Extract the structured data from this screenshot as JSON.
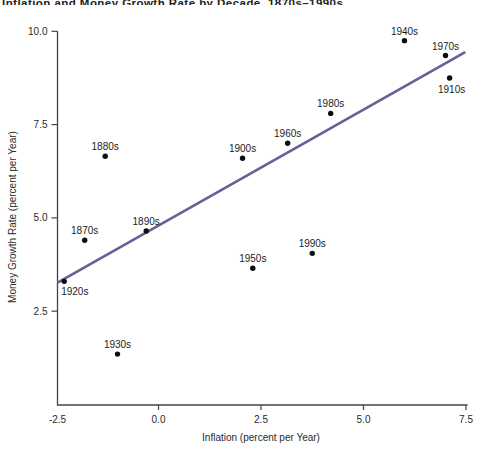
{
  "title_clipped": "Inflation and Money Growth Rate by Decade, 1870s–1990s",
  "colors": {
    "background": "#ffffff",
    "axis": "#454545",
    "tick_text": "#2a2a2a",
    "dot": "#0d0d0d",
    "label_text": "#1c1c1c",
    "trend_line": "#63639a"
  },
  "chart_data": {
    "type": "scatter",
    "xlabel": "Inflation (percent per Year)",
    "ylabel": "Money Growth Rate (percent per Year)",
    "xlim": [
      -2.5,
      7.5
    ],
    "ylim": [
      0,
      10
    ],
    "grid": false,
    "legend": "none",
    "x_ticks": {
      "values": [
        -2.5,
        0,
        2.5,
        5,
        7.5
      ],
      "labels": [
        "-2.5",
        "0.0",
        "2.5",
        "5.0",
        "7.5"
      ]
    },
    "y_ticks": {
      "values": [
        2.5,
        5,
        7.5,
        10
      ],
      "labels": [
        "2.5",
        "5.0",
        "7.5",
        "10.0"
      ]
    },
    "points": [
      {
        "label": "1870s",
        "x": -1.8,
        "y": 4.4,
        "label_pos": "above"
      },
      {
        "label": "1880s",
        "x": -1.3,
        "y": 6.65,
        "label_pos": "above"
      },
      {
        "label": "1890s",
        "x": -0.3,
        "y": 4.65,
        "label_pos": "above"
      },
      {
        "label": "1900s",
        "x": 2.05,
        "y": 6.6,
        "label_pos": "above"
      },
      {
        "label": "1910s",
        "x": 7.1,
        "y": 8.75,
        "label_pos": "below"
      },
      {
        "label": "1920s",
        "x": -2.3,
        "y": 3.3,
        "label_pos": "below-left"
      },
      {
        "label": "1930s",
        "x": -1.0,
        "y": 1.35,
        "label_pos": "above"
      },
      {
        "label": "1940s",
        "x": 6.0,
        "y": 9.75,
        "label_pos": "above"
      },
      {
        "label": "1950s",
        "x": 2.3,
        "y": 3.65,
        "label_pos": "above"
      },
      {
        "label": "1960s",
        "x": 3.15,
        "y": 7.0,
        "label_pos": "above"
      },
      {
        "label": "1970s",
        "x": 7.0,
        "y": 9.35,
        "label_pos": "above"
      },
      {
        "label": "1980s",
        "x": 4.2,
        "y": 7.8,
        "label_pos": "above"
      },
      {
        "label": "1990s",
        "x": 3.75,
        "y": 4.05,
        "label_pos": "above"
      }
    ],
    "trend_line": {
      "x1": -2.44,
      "y1": 3.28,
      "x2": 7.46,
      "y2": 9.43
    }
  }
}
